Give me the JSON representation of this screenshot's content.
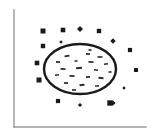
{
  "figure": {
    "background_color": "#ffffff",
    "ink_color": "#1a1a1a",
    "axis_color": "#9a9a9a",
    "title": "",
    "caption": ""
  },
  "axes": {
    "y_axis": {
      "x": 14,
      "y_top": 10,
      "y_bottom": 127,
      "width": 1.4,
      "color": "#9a9a9a"
    },
    "x_axis": {
      "y": 127,
      "x_left": 14,
      "x_right": 146,
      "width": 1.4,
      "color": "#9a9a9a"
    }
  },
  "chart_data": {
    "type": "scatter",
    "title": "",
    "xlabel": "",
    "ylabel": "",
    "xlim": [
      0,
      155
    ],
    "ylim": [
      140,
      0
    ],
    "grid": false,
    "legend": "none",
    "annotations": [
      "Closed ellipse outline enclosing a field of short dash marks",
      "Ring of filled square and diamond markers distributed outside the ellipse"
    ],
    "shapes": [
      {
        "name": "ellipse-outline",
        "kind": "ellipse",
        "cx": 80,
        "cy": 69,
        "rx": 36,
        "ry": 25,
        "stroke": "#1a1a1a",
        "stroke_width": 2.4,
        "fill": "none"
      }
    ],
    "series": [
      {
        "name": "outer-square-markers",
        "marker": "square",
        "color": "#1a1a1a",
        "points": [
          {
            "x": 43,
            "y": 31,
            "size": 5.0
          },
          {
            "x": 63,
            "y": 30,
            "size": 4.6
          },
          {
            "x": 99,
            "y": 31,
            "size": 4.4
          },
          {
            "x": 43,
            "y": 46,
            "size": 4.4
          },
          {
            "x": 37,
            "y": 63,
            "size": 4.6
          },
          {
            "x": 39,
            "y": 80,
            "size": 5.0
          },
          {
            "x": 130,
            "y": 50,
            "size": 4.2
          },
          {
            "x": 136,
            "y": 70,
            "size": 4.0
          },
          {
            "x": 58,
            "y": 101,
            "size": 4.2
          },
          {
            "x": 110,
            "y": 103,
            "size": 5.4
          }
        ]
      },
      {
        "name": "outer-diamond-markers",
        "marker": "diamond",
        "color": "#1a1a1a",
        "points": [
          {
            "x": 80,
            "y": 29,
            "size": 6.0
          },
          {
            "x": 61,
            "y": 42,
            "size": 3.6
          },
          {
            "x": 113,
            "y": 41,
            "size": 5.4
          },
          {
            "x": 124,
            "y": 88,
            "size": 3.4
          },
          {
            "x": 80,
            "y": 105,
            "size": 4.2
          },
          {
            "x": 113,
            "y": 103,
            "size": 5.2
          }
        ]
      },
      {
        "name": "interior-dash-marks",
        "marker": "dash",
        "color": "#2a2a2a",
        "points": [
          {
            "x": 67,
            "y": 56,
            "w": 5,
            "h": 1.6,
            "r": -8
          },
          {
            "x": 88,
            "y": 54,
            "w": 4,
            "h": 1.8,
            "r": 6
          },
          {
            "x": 100,
            "y": 57,
            "w": 5,
            "h": 1.6,
            "r": 0
          },
          {
            "x": 58,
            "y": 62,
            "w": 4,
            "h": 1.6,
            "r": 4
          },
          {
            "x": 76,
            "y": 61,
            "w": 3,
            "h": 1.6,
            "r": -10
          },
          {
            "x": 91,
            "y": 62,
            "w": 5,
            "h": 1.8,
            "r": 2
          },
          {
            "x": 106,
            "y": 64,
            "w": 4,
            "h": 1.6,
            "r": -6
          },
          {
            "x": 63,
            "y": 69,
            "w": 5,
            "h": 1.8,
            "r": 3
          },
          {
            "x": 79,
            "y": 68,
            "w": 6,
            "h": 2.0,
            "r": -4
          },
          {
            "x": 96,
            "y": 70,
            "w": 4,
            "h": 1.6,
            "r": 8
          },
          {
            "x": 110,
            "y": 72,
            "w": 3,
            "h": 1.6,
            "r": 0
          },
          {
            "x": 57,
            "y": 75,
            "w": 4,
            "h": 1.6,
            "r": -5
          },
          {
            "x": 72,
            "y": 76,
            "w": 5,
            "h": 1.8,
            "r": 5
          },
          {
            "x": 88,
            "y": 77,
            "w": 4,
            "h": 1.6,
            "r": -3
          },
          {
            "x": 101,
            "y": 78,
            "w": 5,
            "h": 1.8,
            "r": 6
          },
          {
            "x": 66,
            "y": 83,
            "w": 4,
            "h": 1.6,
            "r": 4
          },
          {
            "x": 82,
            "y": 85,
            "w": 5,
            "h": 1.8,
            "r": -6
          },
          {
            "x": 97,
            "y": 86,
            "w": 4,
            "h": 1.6,
            "r": 2
          },
          {
            "x": 74,
            "y": 90,
            "w": 4,
            "h": 1.6,
            "r": 0
          },
          {
            "x": 90,
            "y": 50,
            "w": 3,
            "h": 1.6,
            "r": 0
          }
        ]
      }
    ]
  }
}
